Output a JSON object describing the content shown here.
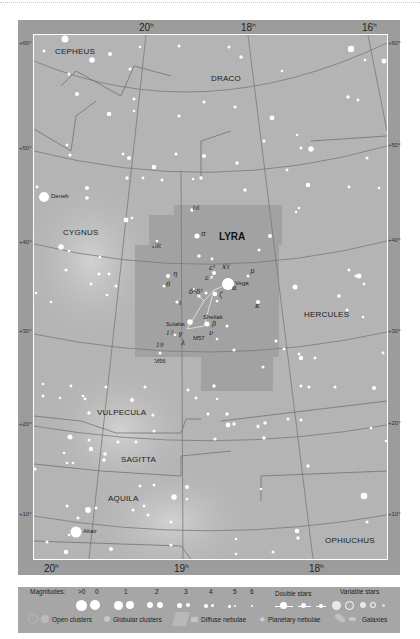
{
  "map": {
    "constellation_focus": "LYRA",
    "ra_labels_top": [
      {
        "label": "20",
        "x": 145
      },
      {
        "label": "18",
        "x": 247
      },
      {
        "label": "16",
        "x": 368
      }
    ],
    "ra_labels_bottom": [
      {
        "label": "20",
        "x": 50
      },
      {
        "label": "19",
        "x": 180
      },
      {
        "label": "18",
        "x": 315
      }
    ],
    "ra_suffix": "h",
    "dec_labels_left": [
      {
        "label": "+60°",
        "y": 43
      },
      {
        "label": "+50°",
        "y": 148
      },
      {
        "label": "+40°",
        "y": 242
      },
      {
        "label": "+30°",
        "y": 331
      },
      {
        "label": "+20°",
        "y": 424
      },
      {
        "label": "+10°",
        "y": 514
      }
    ],
    "dec_labels_right": [
      {
        "label": "+60°",
        "y": 43
      },
      {
        "label": "+50°",
        "y": 145
      },
      {
        "label": "+40°",
        "y": 240
      },
      {
        "label": "+30°",
        "y": 331
      },
      {
        "label": "+20°",
        "y": 423
      },
      {
        "label": "+10°",
        "y": 514
      }
    ],
    "constellations": [
      {
        "name": "CEPHEUS",
        "x": 55,
        "y": 47
      },
      {
        "name": "DRACO",
        "x": 211,
        "y": 74
      },
      {
        "name": "CYGNUS",
        "x": 63,
        "y": 228
      },
      {
        "name": "HERCULES",
        "x": 304,
        "y": 313
      },
      {
        "name": "VULPECULA",
        "x": 97,
        "y": 409
      },
      {
        "name": "SAGITTA",
        "x": 121,
        "y": 455
      },
      {
        "name": "AQUILA",
        "x": 108,
        "y": 494
      },
      {
        "name": "OPHIUCHUS",
        "x": 325,
        "y": 537
      }
    ],
    "star_names": [
      {
        "name": "Deneb",
        "x": 52,
        "y": 194
      },
      {
        "name": "Vega",
        "x": 235,
        "y": 258
      },
      {
        "name": "Sheliak",
        "x": 203,
        "y": 317
      },
      {
        "name": "Sulafat",
        "x": 167,
        "y": 322
      },
      {
        "name": "M57",
        "x": 193,
        "y": 336
      },
      {
        "name": "M56",
        "x": 156,
        "y": 360
      },
      {
        "name": "Altair",
        "x": 83,
        "y": 531
      }
    ],
    "star_designations": [
      {
        "label": "16",
        "x": 192,
        "y": 206
      },
      {
        "label": "RR",
        "x": 152,
        "y": 243
      },
      {
        "label": "π",
        "x": 200,
        "y": 234
      },
      {
        "label": "η",
        "x": 174,
        "y": 273
      },
      {
        "label": "θ",
        "x": 167,
        "y": 283
      },
      {
        "label": "ε¹",
        "x": 209,
        "y": 266
      },
      {
        "label": "ε²",
        "x": 205,
        "y": 276
      },
      {
        "label": "XY",
        "x": 223,
        "y": 265
      },
      {
        "label": "μ",
        "x": 251,
        "y": 270
      },
      {
        "label": "α",
        "x": 232,
        "y": 285
      },
      {
        "label": "δ²δ¹",
        "x": 190,
        "y": 290
      },
      {
        "label": "ζ",
        "x": 220,
        "y": 293
      },
      {
        "label": "κ",
        "x": 255,
        "y": 305
      },
      {
        "label": "ι",
        "x": 178,
        "y": 301
      },
      {
        "label": "β",
        "x": 213,
        "y": 323
      },
      {
        "label": "ν",
        "x": 209,
        "y": 330
      },
      {
        "label": "17",
        "x": 167,
        "y": 330
      },
      {
        "label": "γ",
        "x": 177,
        "y": 332
      },
      {
        "label": "λ",
        "x": 182,
        "y": 341
      },
      {
        "label": "19",
        "x": 157,
        "y": 342
      }
    ]
  },
  "legend": {
    "magnitudes_label": "Magnitudes:",
    "magnitudes": [
      ">0",
      "0",
      "1",
      "2",
      "3",
      "4",
      "5",
      "6"
    ],
    "double_stars_label": "Double stars",
    "variable_stars_label": "Variable stars",
    "open_clusters_label": "Open clusters",
    "globular_clusters_label": "Globular clusters",
    "diffuse_nebulae_label": "Diffuse nebulae",
    "planetary_nebulae_label": "Planetary nebulae",
    "galaxies_label": "Galaxies"
  }
}
